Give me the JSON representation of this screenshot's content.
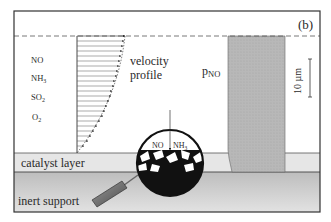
{
  "panel_label": "(b)",
  "species": [
    "NO",
    "NH3",
    "SO2",
    "O2"
  ],
  "species_display": [
    {
      "base": "NO",
      "sub": ""
    },
    {
      "base": "NH",
      "sub": "3"
    },
    {
      "base": "SO",
      "sub": "2"
    },
    {
      "base": "O",
      "sub": "2"
    }
  ],
  "velocity_label": {
    "line1": "velocity",
    "line2": "profile"
  },
  "pressure_label": {
    "base": "p",
    "sub": "NO"
  },
  "scale_bar": {
    "value": "10 µm"
  },
  "layers": {
    "catalyst": "catalyst layer",
    "support": "inert support"
  },
  "magnifier": {
    "left_label": "NO",
    "right_label": {
      "base": "NH",
      "sub": "3"
    }
  },
  "colors": {
    "frame": "#3a3a3a",
    "pno_column": "#b9b9b9",
    "catalyst_layer": "#e4e4e4",
    "support": "#cfcfcf",
    "magnifier_fill": "#111111"
  }
}
